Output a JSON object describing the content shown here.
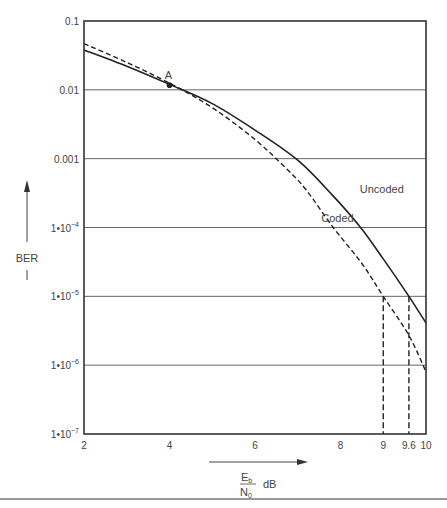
{
  "chart_data": {
    "type": "line",
    "title": "",
    "xlabel": "Eb/N0 dB",
    "xlabel_parts": {
      "num": "E",
      "num_sub": "b",
      "den": "N",
      "den_sub": "0",
      "unit": "dB"
    },
    "ylabel": "BER",
    "xlim": [
      2,
      10
    ],
    "ylim": [
      1e-07,
      0.1
    ],
    "yscale": "log",
    "grid": "horizontal at each decade",
    "x_ticks": [
      {
        "value": 2,
        "label": "2"
      },
      {
        "value": 4,
        "label": "4"
      },
      {
        "value": 6,
        "label": "6"
      },
      {
        "value": 8,
        "label": "8"
      },
      {
        "value": 9,
        "label": "9"
      },
      {
        "value": 9.6,
        "label": "9.6"
      },
      {
        "value": 10,
        "label": "10"
      }
    ],
    "y_ticks": [
      {
        "exp": -1,
        "label": "0.1"
      },
      {
        "exp": -2,
        "label": "0.01"
      },
      {
        "exp": -3,
        "label": "0.001"
      },
      {
        "exp": -4,
        "label": "1•10",
        "sup": "−4"
      },
      {
        "exp": -5,
        "label": "1•10",
        "sup": "−5"
      },
      {
        "exp": -6,
        "label": "1•10",
        "sup": "−6"
      },
      {
        "exp": -7,
        "label": "1•10",
        "sup": "−7"
      }
    ],
    "series": [
      {
        "name": "Uncoded",
        "style": "solid",
        "x": [
          2,
          3,
          4,
          5,
          6,
          7,
          7.8,
          8.47,
          9,
          9.6,
          10
        ],
        "y": [
          0.038,
          0.022,
          0.012,
          0.0063,
          0.0026,
          0.00095,
          0.0003,
          0.0001,
          3.5e-05,
          1e-05,
          4.1e-06
        ]
      },
      {
        "name": "Coded",
        "style": "dashed",
        "x": [
          2,
          3,
          4,
          5,
          6,
          6.75,
          7.2,
          7.83,
          8.5,
          9,
          9.6,
          10
        ],
        "y": [
          0.047,
          0.025,
          0.0125,
          0.0055,
          0.0019,
          0.0007,
          0.00035,
          0.0001,
          3e-05,
          1e-05,
          2.7e-06,
          8e-07
        ]
      }
    ],
    "annotations": [
      {
        "type": "point",
        "label": "A",
        "x": 4,
        "y": 0.0117
      },
      {
        "type": "text",
        "label": "Uncoded",
        "x": 8.45,
        "y": 0.00032
      },
      {
        "type": "text",
        "label": "Coded",
        "x": 7.55,
        "y": 0.00012
      },
      {
        "type": "vline-dashed",
        "x": 9,
        "from_y": 1e-07,
        "to_y": 1e-05
      },
      {
        "type": "vline-dashed",
        "x": 9.6,
        "from_y": 1e-07,
        "to_y": 1e-05
      }
    ],
    "axis_arrows": {
      "y": "BER increasing upward",
      "x": "Eb/N0 increasing rightward"
    }
  }
}
